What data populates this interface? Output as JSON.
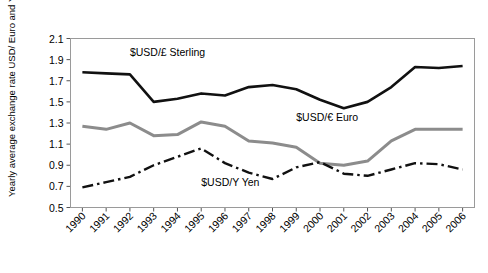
{
  "chart_data": {
    "type": "line",
    "title": "",
    "xlabel": "",
    "ylabel": "Yearly average exchange rate USD/ Euro and Yen",
    "categories": [
      "1990",
      "1991",
      "1992",
      "1993",
      "1994",
      "1995",
      "1996",
      "1997",
      "1998",
      "1999",
      "2000",
      "2001",
      "2002",
      "2003",
      "2004",
      "2005",
      "2006"
    ],
    "ylim": [
      0.5,
      2.1
    ],
    "ytick_step": 0.2,
    "yticks": [
      "0.5",
      "0.7",
      "0.9",
      "1.1",
      "1.3",
      "1.5",
      "1.7",
      "1.9",
      "2.1"
    ],
    "grid": false,
    "legend": "inline-annotations",
    "series": [
      {
        "name": "$USD/£ Sterling",
        "style": "solid",
        "color": "#111111",
        "width": 2.6,
        "label_x": "1992",
        "label_y": 1.93,
        "values": [
          1.78,
          1.77,
          1.76,
          1.5,
          1.53,
          1.58,
          1.56,
          1.64,
          1.66,
          1.62,
          1.52,
          1.44,
          1.5,
          1.64,
          1.83,
          1.82,
          1.84
        ]
      },
      {
        "name": "$USD/€ Euro",
        "style": "solid",
        "color": "#8c8c8c",
        "width": 3.0,
        "label_x": "1999",
        "label_y": 1.32,
        "values": [
          1.27,
          1.24,
          1.3,
          1.18,
          1.19,
          1.31,
          1.27,
          1.13,
          1.11,
          1.07,
          0.92,
          0.9,
          0.94,
          1.13,
          1.24,
          1.24,
          1.24
        ]
      },
      {
        "name": "$USD/Y Yen",
        "style": "dash-dot",
        "color": "#111111",
        "width": 2.4,
        "label_x": "1995",
        "label_y": 0.7,
        "values": [
          0.69,
          0.74,
          0.79,
          0.9,
          0.98,
          1.06,
          0.92,
          0.83,
          0.77,
          0.88,
          0.93,
          0.82,
          0.8,
          0.86,
          0.92,
          0.91,
          0.86
        ]
      }
    ]
  }
}
